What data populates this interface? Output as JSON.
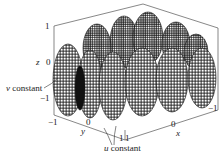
{
  "figure": {
    "type": "3d-parametric-surface",
    "annotations": {
      "v_constant": "v constant",
      "u_constant": "u constant"
    },
    "axes": {
      "z": {
        "label": "z",
        "ticks": [
          "1",
          "0",
          "−1"
        ]
      },
      "y": {
        "label": "y",
        "ticks": [
          "−1",
          "0",
          "1"
        ]
      },
      "x": {
        "label": "x",
        "ticks": [
          "1",
          "0",
          "−1"
        ]
      }
    },
    "colors": {
      "mesh": "#111111",
      "box": "#555555",
      "background": "#ffffff"
    }
  }
}
